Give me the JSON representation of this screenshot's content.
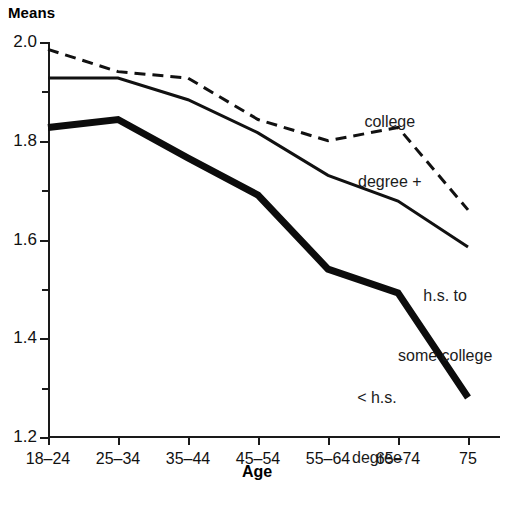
{
  "chart_data": {
    "type": "line",
    "title": "Means",
    "xlabel": "Age",
    "ylabel": "",
    "categories": [
      "18–24",
      "25–34",
      "35–44",
      "45–54",
      "55–64",
      "65–74",
      "75"
    ],
    "ylim": [
      1.2,
      2.0
    ],
    "y_major_ticks": [
      "2.0",
      "1.8",
      "1.6",
      "1.4",
      "1.2"
    ],
    "y_major_values": [
      2.0,
      1.8,
      1.6,
      1.4,
      1.2
    ],
    "y_minor_values": [
      1.9,
      1.7,
      1.5,
      1.3
    ],
    "grid": false,
    "legend_position": "inline-annotations",
    "series": [
      {
        "name": "college degree +",
        "label_line1": "college",
        "label_line2": "degree +",
        "style": "dashed",
        "color": "#111111",
        "width": 3,
        "values": [
          1.985,
          1.94,
          1.927,
          1.843,
          1.8,
          1.827,
          1.66
        ]
      },
      {
        "name": "h.s. to some college",
        "label_line1": "h.s. to",
        "label_line2": "some college",
        "style": "solid-thin",
        "color": "#111111",
        "width": 3,
        "values": [
          1.927,
          1.927,
          1.883,
          1.816,
          1.73,
          1.678,
          1.585
        ]
      },
      {
        "name": "< h.s. degree",
        "label_line1": "< h.s.",
        "label_line2": "degree",
        "style": "solid-bold",
        "color": "#0c0c0c",
        "width": 7,
        "values": [
          1.827,
          1.843,
          1.765,
          1.69,
          1.54,
          1.492,
          1.28
        ]
      }
    ]
  },
  "watermark": "",
  "colors": {
    "axis": "#1a1a1a",
    "text": "#111111",
    "background": "#ffffff"
  }
}
